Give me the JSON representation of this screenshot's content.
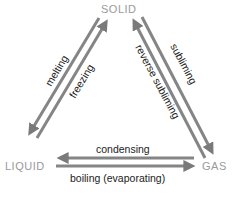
{
  "states": {
    "solid": "SOLID",
    "liquid": "LIQUID",
    "gas": "GAS"
  },
  "processes": {
    "melting": "melting",
    "freezing": "freezing",
    "subliming": "subliming",
    "reverse_subliming": "reverse subliming",
    "condensing": "condensing",
    "boiling": "boiling (evaporating)"
  },
  "colors": {
    "arrow": "#8a8a8a",
    "arrow_edge": "#5e5e5e",
    "state_label": "#9a9a9a",
    "process_label": "#222222"
  }
}
